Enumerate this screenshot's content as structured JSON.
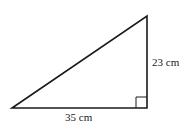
{
  "diagram": {
    "type": "right-triangle",
    "labels": {
      "vertical_side": "23 cm",
      "horizontal_side": "35 cm"
    },
    "right_angle_marker": true,
    "stroke_color": "#1a1a1a"
  }
}
